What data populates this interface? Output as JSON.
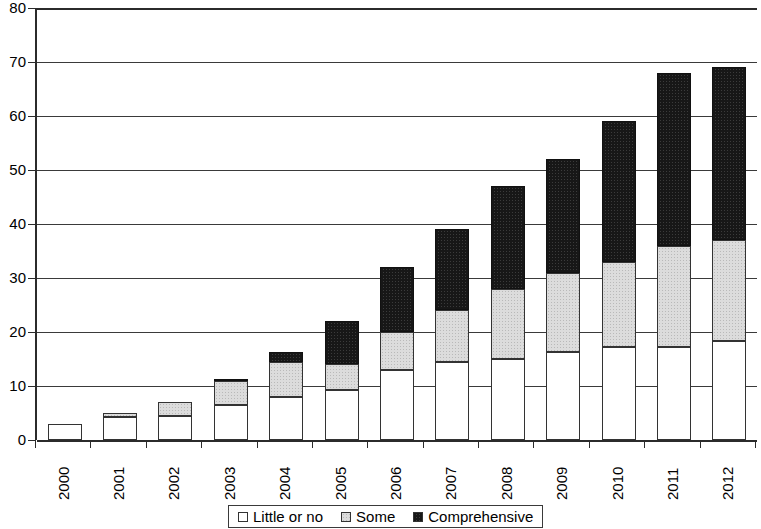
{
  "chart_data": {
    "type": "bar",
    "subtype": "stacked-bar",
    "title": "",
    "subtitle": "",
    "xlabel": "",
    "ylabel": "",
    "categories": [
      "2000",
      "2001",
      "2002",
      "2003",
      "2004",
      "2005",
      "2006",
      "2007",
      "2008",
      "2009",
      "2010",
      "2011",
      "2012"
    ],
    "series": [
      {
        "name": "Little or no",
        "color": "#ffffff",
        "values": [
          3,
          4.3,
          4.5,
          6.5,
          8,
          9.3,
          13,
          14.5,
          15,
          16.3,
          17.3,
          17.3,
          18.3
        ]
      },
      {
        "name": "Some",
        "color": "#dcdcdc",
        "values": [
          0,
          0.7,
          2.5,
          4.4,
          6.5,
          4.7,
          7,
          9.5,
          13,
          14.7,
          15.7,
          18.7,
          18.7
        ]
      },
      {
        "name": "Comprehensive",
        "color": "#171717",
        "values": [
          0,
          0,
          0,
          0.1,
          1.8,
          8,
          12,
          15,
          19,
          21,
          26,
          32,
          32
        ]
      }
    ],
    "totals": [
      3,
      5,
      7,
      11,
      16.3,
      22,
      32,
      39,
      47,
      52,
      59,
      68,
      69
    ],
    "ylim": [
      0,
      80
    ],
    "ytick_step": 10,
    "ytick_labels": [
      "0",
      "10",
      "20",
      "30",
      "40",
      "50",
      "60",
      "70",
      "80"
    ],
    "grid": true,
    "grid_axis": "y",
    "legend_position": "bottom",
    "legend": [
      {
        "label": "Little or no",
        "swatch": "#ffffff"
      },
      {
        "label": "Some",
        "swatch": "#dcdcdc"
      },
      {
        "label": "Comprehensive",
        "swatch": "#171717"
      }
    ]
  }
}
